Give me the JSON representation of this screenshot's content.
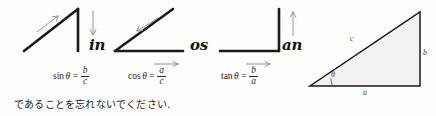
{
  "figure": {
    "background_color": "#fdfdfc",
    "stroke_color": "#1a1a1a",
    "arrow_color": "#8a8a8a",
    "label_color": "#4a4a4a"
  },
  "mnemonics": [
    {
      "name": "sine",
      "shape": "diagonal-up-right-then-vertical-down",
      "letters": "in",
      "arrows": [
        {
          "direction": "up-right",
          "along": "hypotenuse"
        },
        {
          "direction": "down",
          "along": "opposite-side"
        }
      ]
    },
    {
      "name": "cosine",
      "shape": "diagonal-up-right-then-horizontal-base",
      "letters": "os",
      "arrows": [
        {
          "direction": "down-left",
          "along": "hypotenuse"
        },
        {
          "direction": "right",
          "along": "adjacent-side"
        }
      ]
    },
    {
      "name": "tangent",
      "shape": "horizontal-base-then-vertical-up",
      "letters": "an",
      "arrows": [
        {
          "direction": "up",
          "along": "opposite-side"
        },
        {
          "direction": "right",
          "along": "adjacent-side"
        }
      ]
    }
  ],
  "formulas": [
    {
      "function": "sin",
      "theta": "θ",
      "equals": "=",
      "numerator": "b",
      "denominator": "c",
      "full_text": "sin θ = b/c"
    },
    {
      "function": "cos",
      "theta": "θ",
      "equals": "=",
      "numerator": "a",
      "denominator": "c",
      "full_text": "cos θ = a/c"
    },
    {
      "function": "tan",
      "theta": "θ",
      "equals": "=",
      "numerator": "b",
      "denominator": "a",
      "full_text": "tan θ = b/a"
    }
  ],
  "reference_triangle": {
    "type": "right-triangle",
    "hypotenuse_label": "c",
    "vertical_label": "b",
    "base_label": "a",
    "angle_label": "θ",
    "right_angle_position": "bottom-right"
  },
  "caption": {
    "text": "であることを忘れないでください."
  }
}
